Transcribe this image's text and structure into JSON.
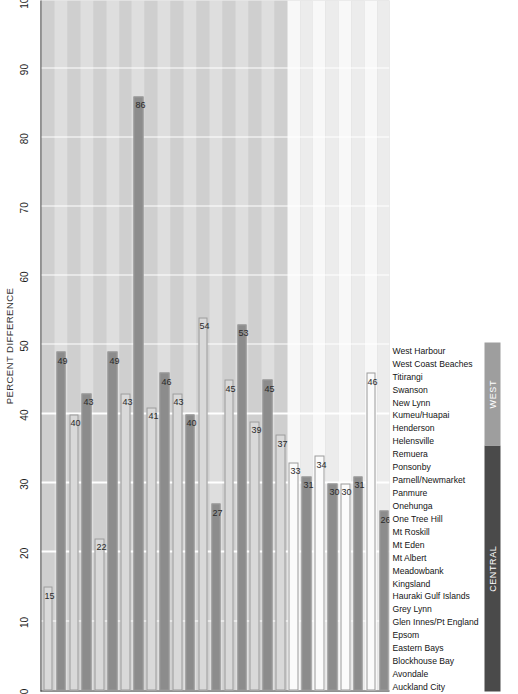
{
  "chart_data": {
    "type": "bar",
    "title": "",
    "xlabel": "",
    "ylabel": "PERCENT DIFFERENCE",
    "orientation": "horizontal-rotated",
    "ylim": [
      0,
      100
    ],
    "ytick_step": 10,
    "yticks": [
      "0",
      "10",
      "20",
      "30",
      "40",
      "50",
      "60",
      "70",
      "80",
      "90",
      "100"
    ],
    "grid": true,
    "legend": "none",
    "categories": [
      "Auckland City",
      "Avondale",
      "Blockhouse Bay",
      "Eastern Bays",
      "Epsom",
      "Glen Innes/Pt England",
      "Grey Lynn",
      "Hauraki Gulf Islands",
      "Kingsland",
      "Meadowbank",
      "Mt Albert",
      "Mt Eden",
      "Mt Roskill",
      "One Tree Hill",
      "Onehunga",
      "Panmure",
      "Parnell/Newmarket",
      "Ponsonby",
      "Remuera",
      "Helensville",
      "Henderson",
      "Kumeu/Huapai",
      "New Lynn",
      "Swanson",
      "Titirangi",
      "West Coast Beaches",
      "West Harbour"
    ],
    "values": [
      15,
      49,
      40,
      43,
      22,
      49,
      43,
      86,
      41,
      46,
      43,
      40,
      54,
      27,
      45,
      53,
      39,
      45,
      37,
      33,
      31,
      34,
      30,
      30,
      31,
      46,
      26
    ],
    "bar_colors": [
      "#d9d9d9",
      "#8c8c8c",
      "#d9d9d9",
      "#8c8c8c",
      "#d9d9d9",
      "#8c8c8c",
      "#d9d9d9",
      "#8c8c8c",
      "#d9d9d9",
      "#8c8c8c",
      "#d9d9d9",
      "#8c8c8c",
      "#d9d9d9",
      "#8c8c8c",
      "#d9d9d9",
      "#8c8c8c",
      "#d9d9d9",
      "#8c8c8c",
      "#d9d9d9",
      "#fbfbfb",
      "#8c8c8c",
      "#fbfbfb",
      "#8c8c8c",
      "#fbfbfb",
      "#8c8c8c",
      "#fbfbfb",
      "#8c8c8c"
    ],
    "regions": [
      {
        "label": "CENTRAL",
        "start": 0,
        "count": 19,
        "color": "#4a4a4a"
      },
      {
        "label": "WEST",
        "start": 19,
        "count": 8,
        "color": "#9e9e9e"
      }
    ],
    "plot_bg_central": "#cfcfcf",
    "plot_bg_west": "#ececec",
    "band_light": "#dedede",
    "band_dark": "#c4c4c4",
    "gridline_color": "#ffffff",
    "axis_color": "#3a3a3a"
  }
}
